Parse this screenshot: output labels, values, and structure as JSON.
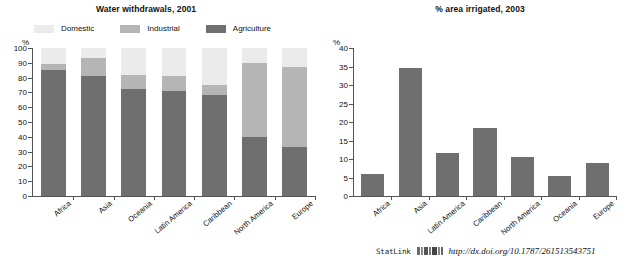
{
  "chart_data": [
    {
      "type": "bar",
      "id": "water-withdrawals",
      "title": "Water withdrawals, 2001",
      "subtitle": "",
      "xlabel": "",
      "ylabel": "%",
      "ylim": [
        0,
        100
      ],
      "yticks": [
        0,
        10,
        20,
        30,
        40,
        50,
        60,
        70,
        80,
        90,
        100
      ],
      "grid": false,
      "stacked": true,
      "legend_position": "top",
      "categories": [
        "Africa",
        "Asia",
        "Oceania",
        "Latin America",
        "Caribbean",
        "North America",
        "Europe"
      ],
      "series": [
        {
          "name": "Agriculture",
          "color": "#6f6f6f",
          "values": [
            85,
            81,
            72,
            71,
            68,
            40,
            33
          ]
        },
        {
          "name": "Industrial",
          "color": "#b5b5b5",
          "values": [
            4,
            12,
            10,
            10,
            7,
            50,
            54
          ]
        },
        {
          "name": "Domestic",
          "color": "#ebebeb",
          "values": [
            11,
            7,
            18,
            19,
            25,
            10,
            13
          ]
        }
      ]
    },
    {
      "type": "bar",
      "id": "area-irrigated",
      "title": "% area irrigated, 2003",
      "subtitle": "",
      "xlabel": "",
      "ylabel": "%",
      "ylim": [
        0,
        40
      ],
      "yticks": [
        0,
        5,
        10,
        15,
        20,
        25,
        30,
        35,
        40
      ],
      "grid": false,
      "stacked": false,
      "legend_position": "none",
      "categories": [
        "Africa",
        "Asia",
        "Latin America",
        "Caribbean",
        "North America",
        "Oceania",
        "Europe"
      ],
      "series": [
        {
          "name": "% area irrigated",
          "color": "#6f6f6f",
          "values": [
            6,
            34.5,
            11.5,
            18.5,
            10.5,
            5.5,
            9
          ]
        }
      ]
    }
  ],
  "left_chart": {
    "title": "Water withdrawals, 2001",
    "axis_unit": "%",
    "legend": [
      {
        "label": "Domestic",
        "color": "#ebebeb"
      },
      {
        "label": "Industrial",
        "color": "#b5b5b5"
      },
      {
        "label": "Agriculture",
        "color": "#6f6f6f"
      }
    ]
  },
  "right_chart": {
    "title": "% area irrigated, 2003",
    "axis_unit": "%"
  },
  "footer": {
    "statlink_label": "StatLink",
    "statlink_icon": "barcode-icon",
    "url": "http://dx.doi.org/10.1787/261513543751"
  }
}
